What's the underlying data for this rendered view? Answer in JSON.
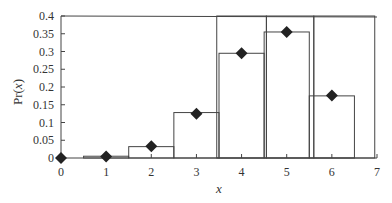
{
  "chart_data": {
    "type": "bar",
    "title": "",
    "xlabel": "x",
    "ylabel": "Pr(x)",
    "xlim": [
      0,
      7
    ],
    "ylim": [
      0,
      0.4
    ],
    "x_ticks": [
      "0",
      "1",
      "2",
      "3",
      "4",
      "5",
      "6",
      "7"
    ],
    "y_ticks": [
      "0",
      "0.05",
      "0.1",
      "0.15",
      "0.2",
      "0.25",
      "0.3",
      "0.35",
      "0.4"
    ],
    "grid": false,
    "legend": null,
    "series": [
      {
        "name": "histogram",
        "kind": "bar",
        "bins": [
          {
            "x0": 0.5,
            "x1": 1.5,
            "value": 0.005
          },
          {
            "x0": 1.5,
            "x1": 2.5,
            "value": 0.032
          },
          {
            "x0": 2.5,
            "x1": 3.5,
            "value": 0.128
          },
          {
            "x0": 3.5,
            "x1": 4.5,
            "value": 0.295
          },
          {
            "x0": 4.5,
            "x1": 5.5,
            "value": 0.355
          },
          {
            "x0": 5.5,
            "x1": 6.5,
            "value": 0.175
          }
        ]
      },
      {
        "name": "Pr(x)",
        "kind": "scatter",
        "marker": "diamond",
        "x": [
          0,
          1,
          2,
          3,
          4,
          5,
          6
        ],
        "values": [
          0.0,
          0.004,
          0.033,
          0.125,
          0.295,
          0.355,
          0.176
        ]
      },
      {
        "name": "outline-regions",
        "kind": "rect",
        "bins": [
          {
            "x0": 3.45,
            "x1": 4.55,
            "value": 0.4
          },
          {
            "x0": 4.55,
            "x1": 5.6,
            "value": 0.4
          },
          {
            "x0": 5.6,
            "x1": 6.95,
            "value": 0.4
          }
        ]
      }
    ],
    "colors": {
      "line": "#444444",
      "marker": "#222222",
      "text": "#333333"
    }
  }
}
